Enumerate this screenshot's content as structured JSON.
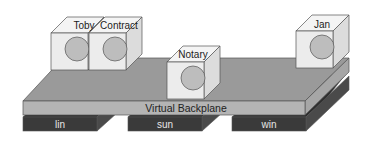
{
  "diagram": {
    "colors": {
      "background": "#ffffff",
      "backplane_top": "#9a9a9a",
      "backplane_front": "#b4b4b4",
      "backplane_side": "#a6a6a6",
      "slab_front": "#3a3a3a",
      "slab_top": "#2e2e2e",
      "slab_side": "#4a4a4a",
      "cube_front": "#ececec",
      "cube_top": "#f4f4f4",
      "cube_side": "#dcdcdc",
      "circle_fill": "#bdbdbd",
      "stroke": "#555555",
      "slab_text": "#e6e6e6",
      "text": "#222222"
    },
    "backplane": {
      "label": "Virtual Backplane"
    },
    "platforms": [
      {
        "label": "lin"
      },
      {
        "label": "sun"
      },
      {
        "label": "win"
      }
    ],
    "nodes": [
      {
        "label": "Toby"
      },
      {
        "label": "Contract"
      },
      {
        "label": "Notary"
      },
      {
        "label": "Jan"
      }
    ]
  }
}
